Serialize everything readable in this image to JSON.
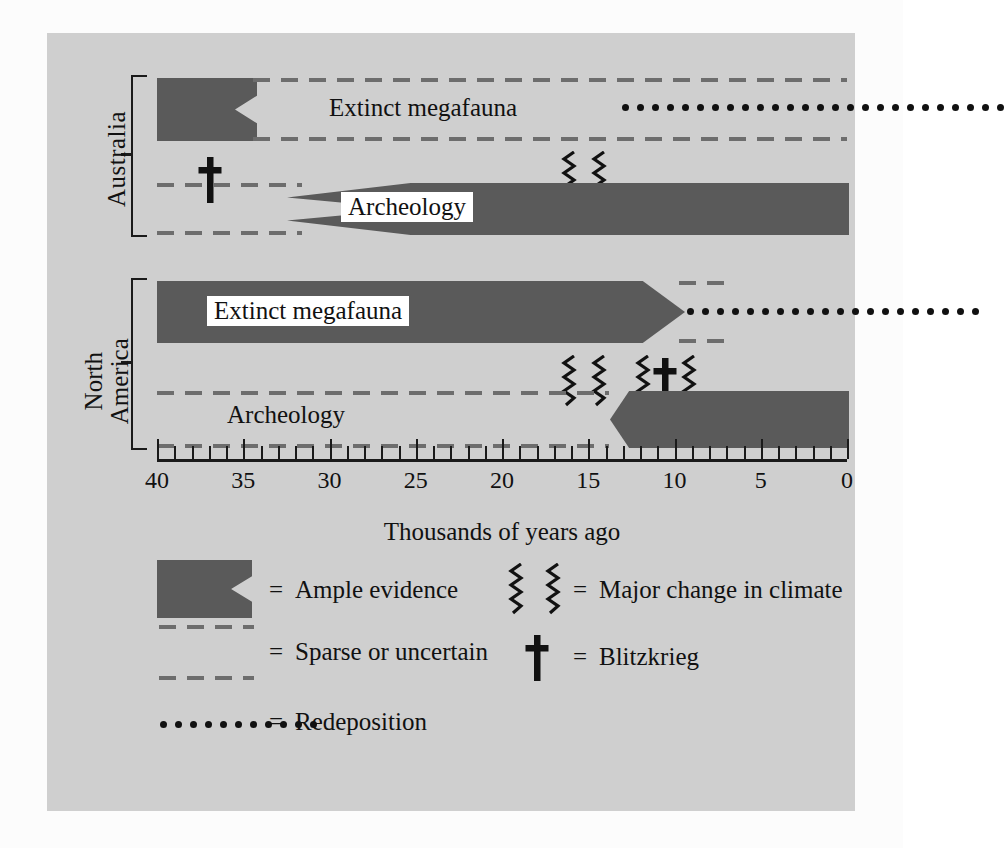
{
  "figure": {
    "axis_title": "Thousands of years ago",
    "region_labels": {
      "australia": "Australia",
      "north_america_line1": "North",
      "north_america_line2": "America"
    },
    "series_labels": {
      "au_megafauna": "Extinct megafauna",
      "au_archeology": "Archeology",
      "na_megafauna": "Extinct megafauna",
      "na_archeology": "Archeology"
    },
    "colors": {
      "panel_background": "#cfcfcf",
      "ample_evidence_fill": "#5a5a5a",
      "ink": "#111111",
      "label_background": "#ffffff"
    }
  },
  "axis": {
    "min": 0,
    "max": 40,
    "direction": "right-to-left",
    "tick_interval": 1,
    "label_interval": 5,
    "tick_labels": [
      "40",
      "35",
      "30",
      "25",
      "20",
      "15",
      "10",
      "5",
      "0"
    ],
    "tick_values": [
      40,
      35,
      30,
      25,
      20,
      15,
      10,
      5,
      0
    ]
  },
  "legend": {
    "left_column": [
      {
        "symbol": "ample-evidence-swatch",
        "equals": "=",
        "label": "Ample evidence"
      },
      {
        "symbol": "sparse-dashed-swatch",
        "equals": "=",
        "label": "Sparse or uncertain"
      },
      {
        "symbol": "redeposition-dotted-swatch",
        "equals": "=",
        "label": "Redeposition"
      }
    ],
    "right_column": [
      {
        "symbol": "climate-zigzag-symbol",
        "equals": "=",
        "label": "Major change in climate"
      },
      {
        "symbol": "blitzkrieg-dagger-symbol",
        "equals": "=",
        "label": "Blitzkrieg"
      }
    ]
  },
  "chart_data": {
    "type": "bar",
    "title": "",
    "subtitle": "",
    "xlabel": "Thousands of years ago",
    "ylabel": "",
    "xlim": [
      40,
      0
    ],
    "x_reversed": true,
    "grid": false,
    "legend_position": "bottom",
    "tick_interval": 1,
    "label_interval": 5,
    "categories": [
      "Australia - Extinct megafauna",
      "Australia - Archeology",
      "North America - Extinct megafauna",
      "North America - Archeology"
    ],
    "series": [
      {
        "name": "Ample evidence",
        "style": "solid-dark-bar",
        "color": "#5a5a5a",
        "segments": [
          {
            "row": "Australia - Extinct megafauna",
            "from_ka": 40.0,
            "to_ka": 34.3,
            "edge_right": "notch"
          },
          {
            "row": "Australia - Archeology",
            "from_ka": 32.0,
            "to_ka": 0.0,
            "edge_left": "notch"
          },
          {
            "row": "North America - Extinct megafauna",
            "from_ka": 40.0,
            "to_ka": 10.3,
            "edge_right": "arrow"
          },
          {
            "row": "North America - Archeology",
            "from_ka": 11.5,
            "to_ka": 0.0,
            "edge_left": "arrow"
          }
        ]
      },
      {
        "name": "Sparse or uncertain",
        "style": "dashed-outline",
        "color": "#6d6d6d",
        "segments": [
          {
            "row": "Australia - Extinct megafauna",
            "from_ka": 34.3,
            "to_ka": 0.0
          },
          {
            "row": "Australia - Archeology",
            "from_ka": 40.0,
            "to_ka": 32.0
          },
          {
            "row": "North America - Extinct megafauna",
            "from_ka": 10.3,
            "to_ka": 7.8
          },
          {
            "row": "North America - Archeology",
            "from_ka": 40.0,
            "to_ka": 11.5
          }
        ]
      },
      {
        "name": "Redeposition",
        "style": "dotted-line",
        "color": "#111111",
        "segments": [
          {
            "row": "Australia - Extinct megafauna",
            "from_ka": 13.0,
            "to_ka": 0.0
          },
          {
            "row": "North America - Extinct megafauna",
            "from_ka": 9.5,
            "to_ka": 0.0
          }
        ]
      }
    ],
    "annotations": [
      {
        "type": "blitzkrieg-dagger",
        "region": "Australia",
        "at_ka": 36.6
      },
      {
        "type": "climate-zigzag",
        "region": "Australia",
        "at_ka": 16.2
      },
      {
        "type": "climate-zigzag",
        "region": "Australia",
        "at_ka": 14.5
      },
      {
        "type": "climate-zigzag",
        "region": "North America",
        "at_ka": 16.2
      },
      {
        "type": "climate-zigzag",
        "region": "North America",
        "at_ka": 14.5
      },
      {
        "type": "climate-zigzag",
        "region": "North America",
        "at_ka": 12.3
      },
      {
        "type": "blitzkrieg-dagger",
        "region": "North America",
        "at_ka": 11.4
      },
      {
        "type": "climate-zigzag",
        "region": "North America",
        "at_ka": 10.5
      }
    ]
  }
}
